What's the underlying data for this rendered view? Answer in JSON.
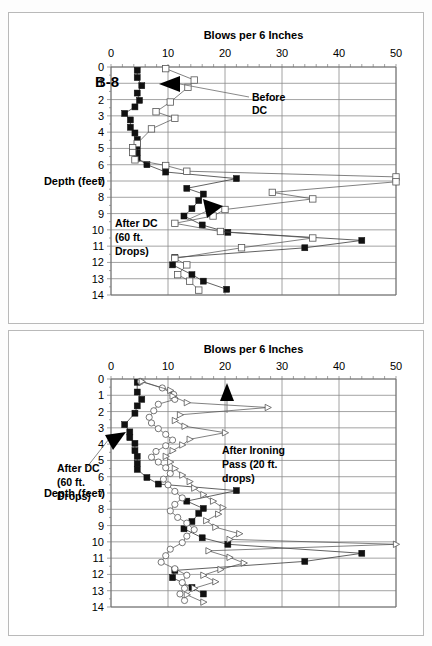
{
  "page": {
    "background": "#ffffff",
    "border_color": "#b9b9b9"
  },
  "panels": [
    {
      "id": "top",
      "borehole_label": "B-8",
      "axis_title": "Blows per 6 Inches",
      "y_axis_label": "Depth (feet)",
      "x_ticks": [
        "0",
        "10",
        "20",
        "30",
        "40",
        "50"
      ],
      "y_ticks": [
        "0",
        "1",
        "2",
        "3",
        "4",
        "5",
        "6",
        "7",
        "8",
        "9",
        "10",
        "11",
        "12",
        "13",
        "14"
      ],
      "annotations": [
        {
          "name": "before-dc",
          "lines": [
            "Before",
            "DC"
          ]
        },
        {
          "name": "after-dc",
          "lines": [
            "After DC",
            "(60 ft.",
            "Drops)"
          ]
        }
      ]
    },
    {
      "id": "bottom",
      "borehole_label": "",
      "axis_title": "Blows per 6 Inches",
      "y_axis_label": "Depth (feet)",
      "x_ticks": [
        "0",
        "10",
        "20",
        "30",
        "40",
        "50"
      ],
      "y_ticks": [
        "0",
        "1",
        "2",
        "3",
        "4",
        "5",
        "6",
        "7",
        "8",
        "9",
        "10",
        "11",
        "12",
        "13",
        "14"
      ],
      "annotations": [
        {
          "name": "after-ironing-pass",
          "lines": [
            "After Ironing",
            "Pass (20 ft.",
            "drops)"
          ]
        },
        {
          "name": "after-dc",
          "lines": [
            "After DC",
            "(60 ft.",
            "Drops)"
          ]
        }
      ]
    }
  ],
  "chart_data": [
    {
      "type": "line",
      "id": "b8-top",
      "title": "Blows per 6 Inches",
      "subtitle": "B-8",
      "xlabel": "Blows per 6 Inches",
      "ylabel": "Depth (feet)",
      "xlim": [
        0,
        50
      ],
      "ylim": [
        0,
        14
      ],
      "y_inverted": true,
      "grid": true,
      "legend": "none",
      "annotations": [
        {
          "text": "Before DC",
          "points_to_series": "Before DC",
          "x": 21,
          "y": 2.5
        },
        {
          "text": "After DC (60 ft. Drops)",
          "points_to_series": "After DC (60 ft. Drops)",
          "x": 5.5,
          "y": 9.2
        }
      ],
      "series": [
        {
          "name": "After DC (60 ft. Drops)",
          "marker": "filled-square",
          "points": [
            [
              4.6,
              0.2
            ],
            [
              4.6,
              0.65
            ],
            [
              5.4,
              1.15
            ],
            [
              4.6,
              1.6
            ],
            [
              5.0,
              2.05
            ],
            [
              4.2,
              2.45
            ],
            [
              2.4,
              2.85
            ],
            [
              3.4,
              3.25
            ],
            [
              3.4,
              3.7
            ],
            [
              4.2,
              4.05
            ],
            [
              4.6,
              4.45
            ],
            [
              4.6,
              4.85
            ],
            [
              4.6,
              5.25
            ],
            [
              4.6,
              5.6
            ],
            [
              6.3,
              6.0
            ],
            [
              9.6,
              6.45
            ],
            [
              22.0,
              6.85
            ],
            [
              13.3,
              7.45
            ],
            [
              16.2,
              7.8
            ],
            [
              15.4,
              8.2
            ],
            [
              14.2,
              8.7
            ],
            [
              12.8,
              9.15
            ],
            [
              16.0,
              9.7
            ],
            [
              20.5,
              10.15
            ],
            [
              44.0,
              10.65
            ],
            [
              34.0,
              11.1
            ],
            [
              11.2,
              11.7
            ],
            [
              10.8,
              12.15
            ],
            [
              14.2,
              12.75
            ],
            [
              16.2,
              13.15
            ],
            [
              20.3,
              13.65
            ]
          ]
        },
        {
          "name": "Before DC",
          "marker": "open-square",
          "points": [
            [
              9.6,
              0.1
            ],
            [
              14.6,
              0.8
            ],
            [
              13.5,
              1.25
            ],
            [
              10.4,
              2.15
            ],
            [
              7.9,
              2.75
            ],
            [
              11.2,
              3.15
            ],
            [
              7.1,
              3.8
            ],
            [
              4.6,
              4.7
            ],
            [
              3.8,
              4.95
            ],
            [
              3.8,
              5.25
            ],
            [
              4.2,
              5.7
            ],
            [
              9.6,
              6.05
            ],
            [
              13.3,
              6.4
            ],
            [
              50.0,
              6.75
            ],
            [
              50.0,
              7.05
            ],
            [
              28.3,
              7.7
            ],
            [
              35.4,
              8.1
            ],
            [
              20.0,
              8.75
            ],
            [
              17.9,
              9.15
            ],
            [
              11.2,
              9.6
            ],
            [
              19.2,
              10.1
            ],
            [
              35.4,
              10.5
            ],
            [
              22.9,
              11.1
            ],
            [
              11.2,
              11.75
            ],
            [
              13.3,
              12.15
            ],
            [
              11.7,
              12.75
            ],
            [
              13.8,
              13.15
            ],
            [
              15.4,
              13.7
            ]
          ]
        }
      ]
    },
    {
      "type": "line",
      "id": "b8-bottom",
      "title": "Blows per 6 Inches",
      "xlabel": "Blows per 6 Inches",
      "ylabel": "Depth (feet)",
      "xlim": [
        0,
        50
      ],
      "ylim": [
        0,
        14
      ],
      "y_inverted": true,
      "grid": true,
      "legend": "none",
      "annotations": [
        {
          "text": "After Ironing Pass (20 ft. drops)",
          "points_to_series": "After Ironing Pass (20 ft. drops)",
          "x": 22,
          "y": 2.1
        },
        {
          "text": "After DC (60 ft. Drops)",
          "points_to_series": "After DC (60 ft. Drops)",
          "x": 6.5,
          "y": 6.7
        }
      ],
      "series": [
        {
          "name": "After DC (60 ft. Drops)",
          "marker": "filled-square",
          "points": [
            [
              4.6,
              0.2
            ],
            [
              4.6,
              0.8
            ],
            [
              5.4,
              1.25
            ],
            [
              4.6,
              1.65
            ],
            [
              4.2,
              2.1
            ],
            [
              2.4,
              2.8
            ],
            [
              3.3,
              3.25
            ],
            [
              3.3,
              3.6
            ],
            [
              4.2,
              3.95
            ],
            [
              4.2,
              4.4
            ],
            [
              4.6,
              4.75
            ],
            [
              4.6,
              5.2
            ],
            [
              4.6,
              5.55
            ],
            [
              6.3,
              6.05
            ],
            [
              8.3,
              6.45
            ],
            [
              22.0,
              6.85
            ],
            [
              13.3,
              7.5
            ],
            [
              16.2,
              7.95
            ],
            [
              15.4,
              8.25
            ],
            [
              14.2,
              8.75
            ],
            [
              12.8,
              9.2
            ],
            [
              16.0,
              9.75
            ],
            [
              20.5,
              10.15
            ],
            [
              44.0,
              10.7
            ],
            [
              34.0,
              11.2
            ],
            [
              11.2,
              11.75
            ],
            [
              10.8,
              12.2
            ],
            [
              14.2,
              12.8
            ],
            [
              16.2,
              13.2
            ]
          ]
        },
        {
          "name": "After Ironing Pass (20 ft. drops) - circles",
          "marker": "open-circle",
          "points": [
            [
              5.2,
              0.15
            ],
            [
              9.0,
              0.55
            ],
            [
              11.0,
              0.95
            ],
            [
              11.2,
              1.25
            ],
            [
              8.3,
              1.55
            ],
            [
              7.5,
              1.95
            ],
            [
              6.7,
              2.35
            ],
            [
              7.1,
              2.7
            ],
            [
              8.3,
              3.05
            ],
            [
              9.6,
              3.4
            ],
            [
              10.8,
              3.75
            ],
            [
              9.6,
              4.1
            ],
            [
              7.9,
              4.45
            ],
            [
              7.1,
              4.8
            ],
            [
              8.3,
              5.1
            ],
            [
              9.6,
              5.45
            ],
            [
              10.4,
              5.8
            ],
            [
              9.2,
              6.15
            ],
            [
              10.0,
              6.5
            ],
            [
              11.2,
              6.9
            ],
            [
              12.5,
              7.3
            ],
            [
              11.2,
              7.7
            ],
            [
              10.4,
              8.1
            ],
            [
              11.7,
              8.5
            ],
            [
              13.3,
              8.85
            ],
            [
              14.6,
              9.25
            ],
            [
              13.3,
              9.65
            ],
            [
              12.5,
              10.05
            ],
            [
              10.4,
              10.45
            ],
            [
              9.6,
              10.85
            ],
            [
              8.8,
              11.25
            ],
            [
              11.2,
              11.65
            ],
            [
              13.3,
              12.05
            ],
            [
              12.5,
              12.5
            ],
            [
              12.9,
              12.85
            ],
            [
              12.1,
              13.2
            ],
            [
              12.9,
              13.6
            ]
          ]
        },
        {
          "name": "After Ironing Pass (20 ft. drops)",
          "marker": "open-triangle",
          "points": [
            [
              5.4,
              0.15
            ],
            [
              10.4,
              0.7
            ],
            [
              10.8,
              1.05
            ],
            [
              13.3,
              1.45
            ],
            [
              27.5,
              1.75
            ],
            [
              12.1,
              2.2
            ],
            [
              11.2,
              2.55
            ],
            [
              12.9,
              2.9
            ],
            [
              20.0,
              3.3
            ],
            [
              13.8,
              3.7
            ],
            [
              12.5,
              4.05
            ],
            [
              10.8,
              4.4
            ],
            [
              9.6,
              4.75
            ],
            [
              10.4,
              5.1
            ],
            [
              11.2,
              5.5
            ],
            [
              12.5,
              5.9
            ],
            [
              13.8,
              6.3
            ],
            [
              14.6,
              6.7
            ],
            [
              16.2,
              7.1
            ],
            [
              17.9,
              7.5
            ],
            [
              19.6,
              7.9
            ],
            [
              18.8,
              8.3
            ],
            [
              16.7,
              8.7
            ],
            [
              18.3,
              9.1
            ],
            [
              22.5,
              9.5
            ],
            [
              20.8,
              9.85
            ],
            [
              50.0,
              10.15
            ],
            [
              17.1,
              10.55
            ],
            [
              20.8,
              10.95
            ],
            [
              23.3,
              11.3
            ],
            [
              19.2,
              11.7
            ],
            [
              16.2,
              12.05
            ],
            [
              18.3,
              12.45
            ],
            [
              14.6,
              12.85
            ],
            [
              13.3,
              13.25
            ],
            [
              16.2,
              13.7
            ]
          ]
        }
      ]
    }
  ]
}
